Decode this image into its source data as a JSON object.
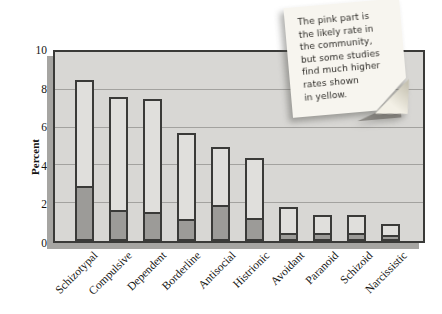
{
  "chart_data": {
    "type": "bar",
    "stacked": true,
    "title": "",
    "xlabel": "",
    "ylabel": "Percent",
    "ylim": [
      0,
      10
    ],
    "yticks": [
      0,
      2,
      4,
      6,
      8,
      10
    ],
    "grid": true,
    "legend_position": "none",
    "categories": [
      "Schizotypal",
      "Compulsive",
      "Dependent",
      "Borderline",
      "Antisocial",
      "Histrionic",
      "Avoidant",
      "Paranoid",
      "Schizoid",
      "Narcissistic"
    ],
    "series": [
      {
        "name": "Likely rate in the community (pink segment)",
        "values": [
          3.0,
          1.7,
          1.6,
          1.2,
          2.0,
          1.3,
          0.5,
          0.5,
          0.5,
          0.4
        ]
      },
      {
        "name": "Higher rate found in some studies (yellow, bar total)",
        "values": [
          8.5,
          7.6,
          7.5,
          5.7,
          5.0,
          4.4,
          1.8,
          1.4,
          1.4,
          0.9
        ]
      }
    ]
  },
  "note": {
    "text": "The pink part is\nthe likely rate in\nthe community,\nbut some studies\nfind much higher\nrates shown\nin yellow."
  },
  "colors": {
    "plot_bg": "#d8d7d4",
    "bar_light": "#e0dfdc",
    "bar_dark": "#9c9b98",
    "outline": "#3a3a38",
    "grid": "#a3a29f",
    "panel_shadow": "#a6a5a2",
    "note_bg": "#f7f5ef"
  }
}
